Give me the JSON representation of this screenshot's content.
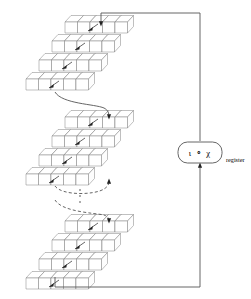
{
  "figure": {
    "domain": "Diagram"
  },
  "register": {
    "box_label": "ι ∘ χ",
    "side_label": "register",
    "box_label_parts": [
      "ι",
      "∘",
      "χ"
    ]
  },
  "slabs": [
    {
      "id": "slab-top",
      "rows": 4,
      "cols": 5,
      "x": 26,
      "y": 14,
      "label": "state-slab-top"
    },
    {
      "id": "slab-middle",
      "rows": 4,
      "cols": 5,
      "x": 26,
      "y": 110,
      "label": "state-slab-middle"
    },
    {
      "id": "slab-bottom",
      "rows": 4,
      "cols": 5,
      "x": 26,
      "y": 214,
      "label": "state-slab-bottom"
    }
  ],
  "connectors": [
    {
      "name": "feedback-top-horizontal",
      "style": "solid"
    },
    {
      "name": "feedback-right-vertical",
      "style": "solid"
    },
    {
      "name": "feedback-bottom-horizontal",
      "style": "solid"
    },
    {
      "name": "slab-top-to-middle",
      "style": "solid-curve"
    },
    {
      "name": "slab-middle-to-ellipsis",
      "style": "dashed-curve"
    },
    {
      "name": "ellipsis-to-slab-bottom",
      "style": "dashed-curve"
    },
    {
      "name": "register-input",
      "style": "solid"
    },
    {
      "name": "register-output",
      "style": "solid"
    }
  ],
  "ellipsis": {
    "glyph": "⋮",
    "dots": 3
  },
  "colors": {
    "wire": "#555555",
    "cube_stroke": "#808080",
    "cube_fill": "#ffffff",
    "arrow": "#222222",
    "text": "#111111",
    "background": "#ffffff"
  },
  "in_slab_arrows": {
    "count_per_slab": 4,
    "direction": "down-left-diagonal"
  }
}
